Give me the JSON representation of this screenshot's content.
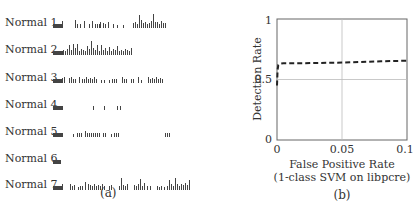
{
  "panel_a": {
    "caption": "(a)",
    "rows": [
      {
        "label": "Normal 1",
        "bars": [
          [
            2,
            4
          ],
          [
            3,
            4
          ],
          [
            4,
            4
          ],
          [
            5,
            4
          ],
          [
            6,
            4
          ],
          [
            7,
            4
          ],
          [
            8,
            4
          ],
          [
            9,
            4
          ],
          [
            10,
            4
          ],
          [
            11,
            7
          ],
          [
            24,
            8
          ],
          [
            26,
            4
          ],
          [
            29,
            4
          ],
          [
            33,
            7
          ],
          [
            38,
            4
          ],
          [
            41,
            7
          ],
          [
            44,
            4
          ],
          [
            46,
            4
          ],
          [
            48,
            4
          ],
          [
            49,
            6
          ],
          [
            52,
            5
          ],
          [
            54,
            4
          ],
          [
            57,
            6
          ],
          [
            62,
            4
          ],
          [
            66,
            3
          ],
          [
            72,
            3
          ],
          [
            82,
            5
          ],
          [
            84,
            6
          ],
          [
            86,
            4
          ],
          [
            88,
            13
          ],
          [
            90,
            8
          ],
          [
            92,
            5
          ],
          [
            94,
            6
          ],
          [
            96,
            4
          ],
          [
            98,
            5
          ],
          [
            100,
            7
          ],
          [
            102,
            14
          ],
          [
            104,
            6
          ],
          [
            106,
            6
          ],
          [
            108,
            4
          ],
          [
            110,
            7
          ],
          [
            112,
            5
          ],
          [
            114,
            5
          ]
        ]
      },
      {
        "label": "Normal 2",
        "bars": [
          [
            2,
            4
          ],
          [
            3,
            4
          ],
          [
            4,
            4
          ],
          [
            5,
            4
          ],
          [
            6,
            4
          ],
          [
            7,
            4
          ],
          [
            8,
            4
          ],
          [
            9,
            4
          ],
          [
            10,
            4
          ],
          [
            11,
            4
          ],
          [
            12,
            5
          ],
          [
            14,
            4
          ],
          [
            16,
            6
          ],
          [
            18,
            10
          ],
          [
            20,
            5
          ],
          [
            22,
            11
          ],
          [
            24,
            7
          ],
          [
            26,
            11
          ],
          [
            28,
            4
          ],
          [
            30,
            6
          ],
          [
            32,
            5
          ],
          [
            34,
            4
          ],
          [
            36,
            9
          ],
          [
            38,
            6
          ],
          [
            40,
            14
          ],
          [
            42,
            7
          ],
          [
            44,
            5
          ],
          [
            46,
            10
          ],
          [
            48,
            4
          ],
          [
            50,
            10
          ],
          [
            52,
            5
          ],
          [
            54,
            7
          ],
          [
            56,
            4
          ],
          [
            58,
            8
          ],
          [
            60,
            4
          ],
          [
            62,
            6
          ],
          [
            64,
            5
          ],
          [
            66,
            9
          ],
          [
            68,
            4
          ],
          [
            70,
            5
          ],
          [
            72,
            4
          ],
          [
            74,
            6
          ],
          [
            76,
            5
          ],
          [
            78,
            4
          ],
          [
            80,
            7
          ]
        ]
      },
      {
        "label": "Normal 3",
        "bars": [
          [
            2,
            4
          ],
          [
            3,
            4
          ],
          [
            4,
            4
          ],
          [
            5,
            4
          ],
          [
            6,
            4
          ],
          [
            7,
            4
          ],
          [
            8,
            4
          ],
          [
            9,
            4
          ],
          [
            10,
            4
          ],
          [
            11,
            5
          ],
          [
            13,
            6
          ],
          [
            18,
            5
          ],
          [
            20,
            6
          ],
          [
            22,
            4
          ],
          [
            24,
            4
          ],
          [
            28,
            6
          ],
          [
            31,
            4
          ],
          [
            33,
            4
          ],
          [
            35,
            6
          ],
          [
            37,
            4
          ],
          [
            39,
            5
          ],
          [
            41,
            4
          ],
          [
            43,
            6
          ],
          [
            45,
            4
          ],
          [
            50,
            3
          ],
          [
            53,
            3
          ],
          [
            58,
            3
          ],
          [
            61,
            4
          ],
          [
            63,
            4
          ],
          [
            65,
            4
          ],
          [
            71,
            6
          ],
          [
            73,
            4
          ],
          [
            75,
            4
          ],
          [
            80,
            4
          ],
          [
            82,
            4
          ],
          [
            87,
            6
          ],
          [
            90,
            3
          ],
          [
            97,
            6
          ],
          [
            99,
            4
          ],
          [
            101,
            5
          ],
          [
            103,
            4
          ],
          [
            105,
            6
          ],
          [
            107,
            4
          ],
          [
            109,
            5
          ],
          [
            111,
            4
          ]
        ]
      },
      {
        "label": "Normal 4",
        "bars": [
          [
            2,
            4
          ],
          [
            3,
            4
          ],
          [
            4,
            4
          ],
          [
            5,
            4
          ],
          [
            6,
            4
          ],
          [
            7,
            4
          ],
          [
            8,
            4
          ],
          [
            9,
            4
          ],
          [
            10,
            4
          ],
          [
            11,
            4
          ],
          [
            42,
            4
          ],
          [
            53,
            4
          ],
          [
            66,
            4
          ],
          [
            69,
            4
          ]
        ]
      },
      {
        "label": "Normal 5",
        "bars": [
          [
            2,
            4
          ],
          [
            3,
            4
          ],
          [
            4,
            4
          ],
          [
            5,
            4
          ],
          [
            6,
            4
          ],
          [
            7,
            4
          ],
          [
            8,
            4
          ],
          [
            9,
            4
          ],
          [
            10,
            4
          ],
          [
            11,
            4
          ],
          [
            22,
            3
          ],
          [
            26,
            4
          ],
          [
            28,
            4
          ],
          [
            30,
            4
          ],
          [
            34,
            6
          ],
          [
            36,
            4
          ],
          [
            38,
            4
          ],
          [
            40,
            4
          ],
          [
            42,
            4
          ],
          [
            44,
            4
          ],
          [
            46,
            4
          ],
          [
            48,
            4
          ],
          [
            52,
            4
          ],
          [
            54,
            4
          ],
          [
            60,
            3
          ],
          [
            63,
            4
          ],
          [
            65,
            4
          ],
          [
            67,
            4
          ],
          [
            114,
            4
          ],
          [
            116,
            4
          ],
          [
            118,
            4
          ]
        ]
      },
      {
        "label": "Normal 6",
        "bars": [
          [
            2,
            4
          ],
          [
            3,
            4
          ],
          [
            4,
            4
          ],
          [
            5,
            4
          ],
          [
            6,
            4
          ],
          [
            7,
            4
          ],
          [
            8,
            4
          ],
          [
            9,
            4
          ]
        ]
      },
      {
        "label": "Normal 7",
        "bars": [
          [
            2,
            4
          ],
          [
            3,
            4
          ],
          [
            4,
            4
          ],
          [
            5,
            4
          ],
          [
            6,
            4
          ],
          [
            7,
            4
          ],
          [
            8,
            4
          ],
          [
            9,
            4
          ],
          [
            10,
            4
          ],
          [
            11,
            6
          ],
          [
            19,
            6
          ],
          [
            21,
            4
          ],
          [
            23,
            5
          ],
          [
            27,
            3
          ],
          [
            29,
            4
          ],
          [
            31,
            4
          ],
          [
            34,
            8
          ],
          [
            37,
            6
          ],
          [
            39,
            5
          ],
          [
            41,
            4
          ],
          [
            43,
            6
          ],
          [
            45,
            4
          ],
          [
            47,
            5
          ],
          [
            49,
            4
          ],
          [
            51,
            6
          ],
          [
            53,
            4
          ],
          [
            58,
            4
          ],
          [
            60,
            5
          ],
          [
            68,
            4
          ],
          [
            70,
            12
          ],
          [
            72,
            5
          ],
          [
            74,
            4
          ],
          [
            76,
            6
          ],
          [
            83,
            5
          ],
          [
            85,
            4
          ],
          [
            87,
            6
          ],
          [
            89,
            11
          ],
          [
            91,
            4
          ],
          [
            93,
            7
          ],
          [
            96,
            4
          ],
          [
            99,
            4
          ],
          [
            106,
            4
          ],
          [
            108,
            3
          ],
          [
            110,
            4
          ],
          [
            113,
            3
          ],
          [
            116,
            4
          ],
          [
            118,
            10
          ],
          [
            120,
            6
          ],
          [
            122,
            4
          ],
          [
            124,
            12
          ],
          [
            126,
            6
          ],
          [
            128,
            4
          ],
          [
            130,
            6
          ],
          [
            132,
            5
          ],
          [
            134,
            7
          ],
          [
            136,
            5
          ],
          [
            138,
            10
          ]
        ]
      }
    ]
  },
  "panel_b": {
    "caption": "(b)"
  },
  "chart_data": {
    "type": "line",
    "title": "",
    "xlabel": "False Positive Rate",
    "xlabel_sub": "(1-class SVM on libpcre)",
    "ylabel": "Detection Rate",
    "xlim": [
      0,
      0.1
    ],
    "ylim": [
      0,
      1
    ],
    "xticks": [
      "0",
      "0.05",
      "0.1"
    ],
    "yticks": [
      "0",
      "0.5",
      "1"
    ],
    "grid": true,
    "series": [
      {
        "name": "ROC",
        "style": "dashed",
        "x": [
          0,
          0.0005,
          0.001,
          0.002,
          0.005,
          0.02,
          0.05,
          0.08,
          0.1
        ],
        "y": [
          0.45,
          0.58,
          0.62,
          0.63,
          0.635,
          0.635,
          0.64,
          0.65,
          0.655
        ]
      }
    ]
  }
}
